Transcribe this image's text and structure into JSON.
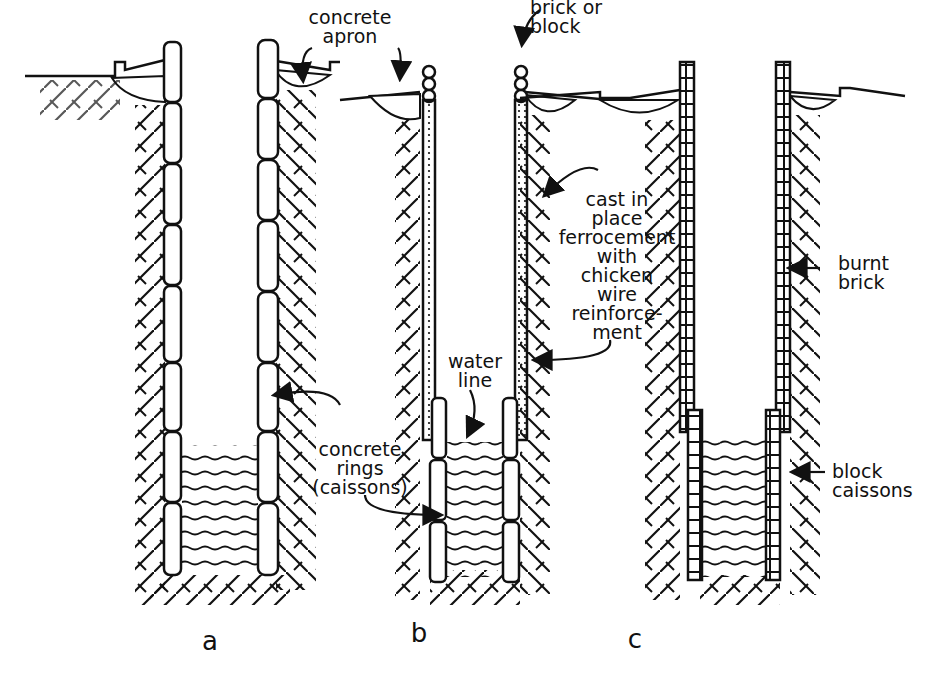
{
  "labels": {
    "concrete_apron": "concrete\napron",
    "brick_or_block": "brick or\nblock",
    "ferrocement": "cast in\nplace\nferrocement\nwith\nchicken\nwire\nreinforce-\nment",
    "burnt_brick": "burnt\nbrick",
    "water_line": "water\nline",
    "concrete_rings": "concrete\nrings\n(caissons)",
    "block_caissons": "block\ncaissons"
  },
  "captions": {
    "a": "a",
    "b": "b",
    "c": "c"
  },
  "colors": {
    "ink": "#111111",
    "background": "#ffffff"
  }
}
